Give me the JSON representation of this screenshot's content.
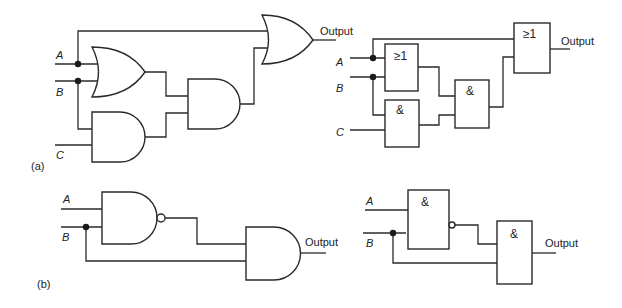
{
  "figure": {
    "part_a": {
      "caption": "(a)",
      "left_circuit": {
        "style": "ANSI distinctive-shape",
        "inputs": [
          "A",
          "B",
          "C"
        ],
        "gates": [
          {
            "id": "or1",
            "type": "OR",
            "inputs": [
              "A",
              "B"
            ]
          },
          {
            "id": "and1",
            "type": "AND",
            "inputs": [
              "B",
              "C"
            ]
          },
          {
            "id": "and2",
            "type": "AND",
            "inputs": [
              "or1",
              "and1"
            ]
          },
          {
            "id": "or2",
            "type": "OR",
            "inputs": [
              "A",
              "and2"
            ]
          }
        ],
        "output_label": "Output"
      },
      "right_circuit": {
        "style": "IEC rectangular",
        "inputs": [
          "A",
          "B",
          "C"
        ],
        "gates": [
          {
            "id": "or1",
            "symbol": "≥1",
            "inputs": [
              "A",
              "B"
            ]
          },
          {
            "id": "and1",
            "symbol": "&",
            "inputs": [
              "B",
              "C"
            ]
          },
          {
            "id": "and2",
            "symbol": "&",
            "inputs": [
              "or1",
              "and1"
            ]
          },
          {
            "id": "or2",
            "symbol": "≥1",
            "inputs": [
              "A",
              "and2"
            ]
          }
        ],
        "output_label": "Output"
      }
    },
    "part_b": {
      "caption": "(b)",
      "left_circuit": {
        "style": "ANSI distinctive-shape",
        "inputs": [
          "A",
          "B"
        ],
        "gates": [
          {
            "id": "nand1",
            "type": "NAND",
            "inputs": [
              "A",
              "B"
            ]
          },
          {
            "id": "and1",
            "type": "AND",
            "inputs": [
              "nand1",
              "B"
            ]
          }
        ],
        "output_label": "Output"
      },
      "right_circuit": {
        "style": "IEC rectangular",
        "inputs": [
          "A",
          "B"
        ],
        "gates": [
          {
            "id": "nand1",
            "symbol": "&",
            "inverted_output": true,
            "inputs": [
              "A",
              "B"
            ]
          },
          {
            "id": "and1",
            "symbol": "&",
            "inputs": [
              "nand1",
              "B"
            ]
          }
        ],
        "output_label": "Output"
      }
    }
  },
  "labels": {
    "A": "A",
    "B": "B",
    "C": "C",
    "output": "Output",
    "or_symbol": "≥1",
    "and_symbol": "&",
    "caption_a": "(a)",
    "caption_b": "(b)"
  }
}
